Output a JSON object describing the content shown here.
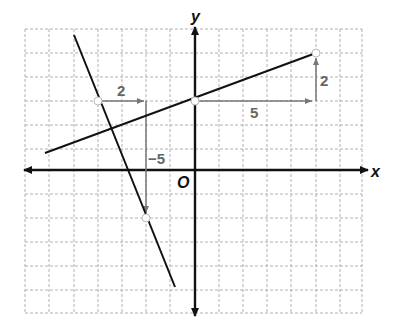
{
  "graph": {
    "x_axis_label": "x",
    "y_axis_label": "y",
    "origin_label": "O",
    "grid": {
      "x_min": -7,
      "x_max": 7,
      "y_min": -6,
      "y_max": 6,
      "unit": 1
    },
    "colors": {
      "line": "#111111",
      "grid": "#b0b0b0",
      "annotation": "#777777",
      "axis": "#111111"
    },
    "lines": [
      {
        "name": "steep-line",
        "slope": -2.5,
        "points": [
          {
            "x": -4,
            "y": 3
          },
          {
            "x": -2,
            "y": -2
          }
        ],
        "rise_run": {
          "run_label": "2",
          "rise_label": "−5"
        }
      },
      {
        "name": "shallow-line",
        "slope": 0.4,
        "points": [
          {
            "x": 0,
            "y": 3
          },
          {
            "x": 5,
            "y": 5
          }
        ],
        "rise_run": {
          "run_label": "5",
          "rise_label": "2"
        }
      }
    ]
  }
}
